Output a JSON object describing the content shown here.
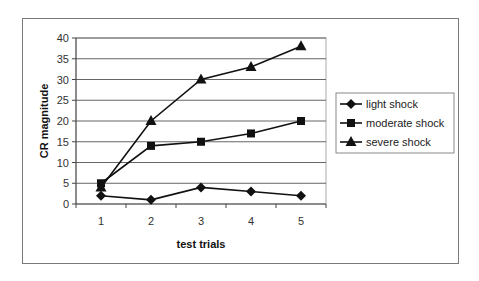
{
  "chart_data": {
    "type": "line",
    "title": "",
    "xlabel": "test trials",
    "ylabel": "CR magnitude",
    "categories": [
      "1",
      "2",
      "3",
      "4",
      "5"
    ],
    "x": [
      1,
      2,
      3,
      4,
      5
    ],
    "ylim": [
      0,
      40
    ],
    "yticks": [
      0,
      5,
      10,
      15,
      20,
      25,
      30,
      35,
      40
    ],
    "grid": true,
    "legend_position": "right",
    "series": [
      {
        "name": "light shock",
        "marker": "diamond",
        "values": [
          2,
          1,
          4,
          3,
          2
        ]
      },
      {
        "name": "moderate shock",
        "marker": "square",
        "values": [
          5,
          14,
          15,
          17,
          20
        ]
      },
      {
        "name": "severe shock",
        "marker": "triangle",
        "values": [
          4,
          20,
          30,
          33,
          38
        ]
      }
    ]
  },
  "colors": {
    "line": "#111111",
    "grid": "#666666",
    "frame": "#7a7a7a"
  }
}
